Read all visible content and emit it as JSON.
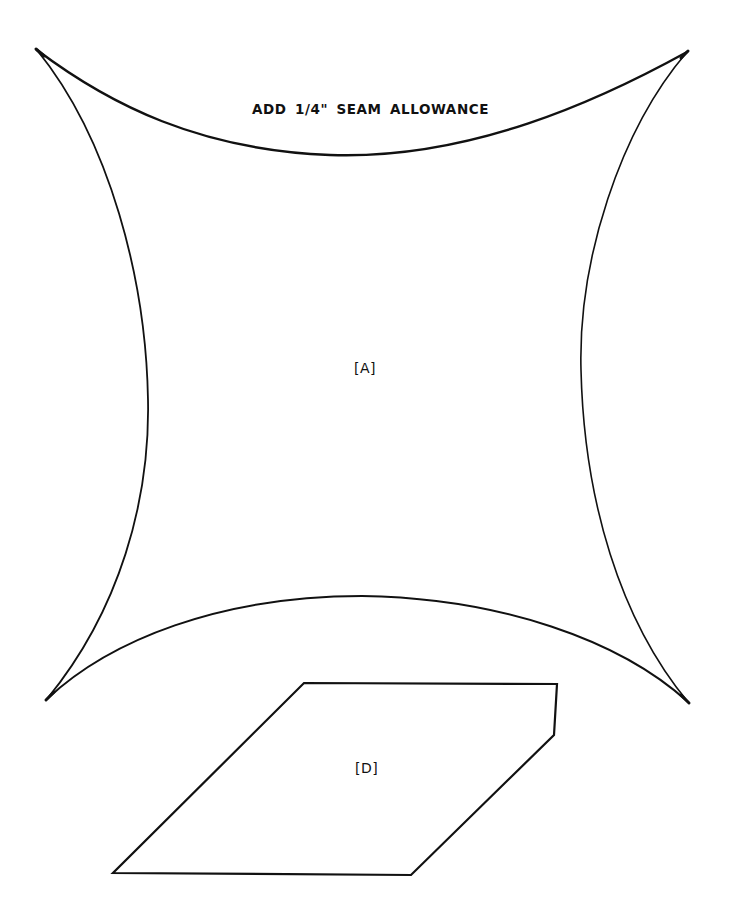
{
  "page": {
    "background": "#ffffff",
    "line_color": "#111111"
  },
  "notes": {
    "seam_allowance": "ADD 1/4\" SEAM ALLOWANCE"
  },
  "pieces": [
    {
      "id": "A",
      "label": "[A]",
      "shape": "four-pointed curved star (concave square)"
    },
    {
      "id": "D",
      "label": "[D]",
      "shape": "irregular parallelogram with clipped corner"
    }
  ]
}
